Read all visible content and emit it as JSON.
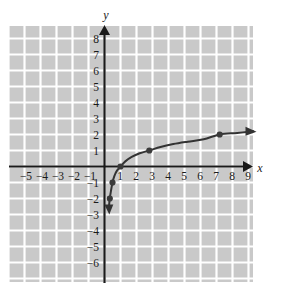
{
  "figure": {
    "title": "",
    "background_color": "#ffffff",
    "grid_fill_color": "#c9c9c9",
    "grid_line_color": "#ffffff",
    "axis_color": "#1a1a1a",
    "curve_color": "#333333",
    "point_color": "#3a3a3a"
  },
  "axes": {
    "x_axis_name": "x",
    "y_axis_name": "y",
    "x_tick_labels": [
      "−5",
      "−4",
      "−3",
      "−2",
      "−1",
      "1",
      "2",
      "3",
      "4",
      "5",
      "6",
      "7",
      "8",
      "9"
    ],
    "y_tick_labels": [
      "8",
      "7",
      "6",
      "5",
      "4",
      "3",
      "2",
      "1",
      "−1",
      "−2",
      "−3",
      "−4",
      "−5",
      "−6"
    ]
  },
  "chart_data": {
    "type": "line",
    "title": "",
    "xlabel": "x",
    "ylabel": "y",
    "xlim": [
      -5.8,
      9.8
    ],
    "ylim": [
      -6.8,
      8.6
    ],
    "grid": true,
    "legend": "none",
    "x_ticks": [
      -5,
      -4,
      -3,
      -2,
      -1,
      1,
      2,
      3,
      4,
      5,
      6,
      7,
      8,
      9
    ],
    "y_ticks": [
      8,
      7,
      6,
      5,
      4,
      3,
      2,
      1,
      -1,
      -2,
      -3,
      -4,
      -5,
      -6
    ],
    "series": [
      {
        "name": "logarithmic curve",
        "description": "increasing logarithmic curve with vertical asymptote at x = 0",
        "marked_points": [
          {
            "x": 0.33,
            "y": -2.0
          },
          {
            "x": 0.5,
            "y": -1.0
          },
          {
            "x": 1.0,
            "y": 0.0
          },
          {
            "x": 2.8,
            "y": 1.0
          },
          {
            "x": 7.2,
            "y": 2.0
          }
        ],
        "x": [
          0.28,
          0.33,
          0.4,
          0.5,
          0.62,
          0.78,
          1.0,
          1.3,
          1.7,
          2.2,
          2.8,
          3.5,
          4.3,
          5.2,
          6.2,
          7.2,
          8.3,
          9.3
        ],
        "y": [
          -2.5,
          -2.0,
          -1.55,
          -1.0,
          -0.58,
          -0.26,
          0.0,
          0.32,
          0.6,
          0.83,
          1.0,
          1.22,
          1.4,
          1.55,
          1.7,
          2.0,
          2.1,
          2.2
        ],
        "arrow_start": {
          "x": 0.27,
          "y": -3.0,
          "direction": "down"
        },
        "arrow_end": {
          "x": 9.5,
          "y": 2.2,
          "direction": "right"
        }
      }
    ]
  }
}
